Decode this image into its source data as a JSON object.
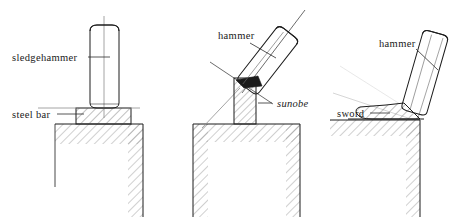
{
  "figure": {
    "background_color": "#ffffff",
    "ink_color": "#1d1d1d",
    "hatch_color": "#5f5f5f",
    "axis_color": "#8d8d8d"
  },
  "panels": [
    {
      "id": "panel-1",
      "name": "sledgehammer-on-steel-bar",
      "labels": [
        {
          "name": "sledgehammer-label",
          "text": "sledgehammer",
          "style": "roman"
        },
        {
          "name": "steel-bar-label",
          "text": "steel  bar",
          "style": "roman"
        }
      ],
      "parts": [
        {
          "name": "sledgehammer-head",
          "shape": "rounded-rectangle",
          "orientation": "vertical"
        },
        {
          "name": "steel-bar",
          "shape": "hatched-rectangle"
        },
        {
          "name": "anvil-block",
          "shape": "hatched-block"
        },
        {
          "name": "hammer-axis-line",
          "shape": "vertical-line"
        },
        {
          "name": "work-surface-line",
          "shape": "horizontal-line"
        }
      ]
    },
    {
      "id": "panel-2",
      "name": "hammer-on-sunobe",
      "labels": [
        {
          "name": "hammer-label",
          "text": "hammer",
          "style": "roman"
        },
        {
          "name": "sunobe-label",
          "text": "sunobe",
          "style": "italic"
        }
      ],
      "parts": [
        {
          "name": "hammer-head",
          "shape": "rounded-rectangle",
          "orientation": "tilted"
        },
        {
          "name": "sunobe-billet",
          "shape": "hatched-rectangle",
          "orientation": "vertical"
        },
        {
          "name": "impact-wedge",
          "shape": "dark-wedge"
        },
        {
          "name": "anvil-block",
          "shape": "hatched-block"
        },
        {
          "name": "hammer-axis-line",
          "shape": "diagonal-line"
        },
        {
          "name": "secondary-axis-line",
          "shape": "diagonal-line"
        }
      ]
    },
    {
      "id": "panel-3",
      "name": "hammer-on-sword",
      "labels": [
        {
          "name": "hammer-label",
          "text": "hammer",
          "style": "roman"
        },
        {
          "name": "sword-label",
          "text": "sword",
          "style": "roman"
        }
      ],
      "parts": [
        {
          "name": "hammer-head",
          "shape": "rounded-rectangle",
          "orientation": "tilted"
        },
        {
          "name": "sword-blade",
          "shape": "tapered-hatched-blade"
        },
        {
          "name": "anvil-block",
          "shape": "hatched-block"
        },
        {
          "name": "hammer-axis-line",
          "shape": "diagonal-line"
        },
        {
          "name": "work-surface-line",
          "shape": "horizontal-line"
        }
      ]
    }
  ]
}
